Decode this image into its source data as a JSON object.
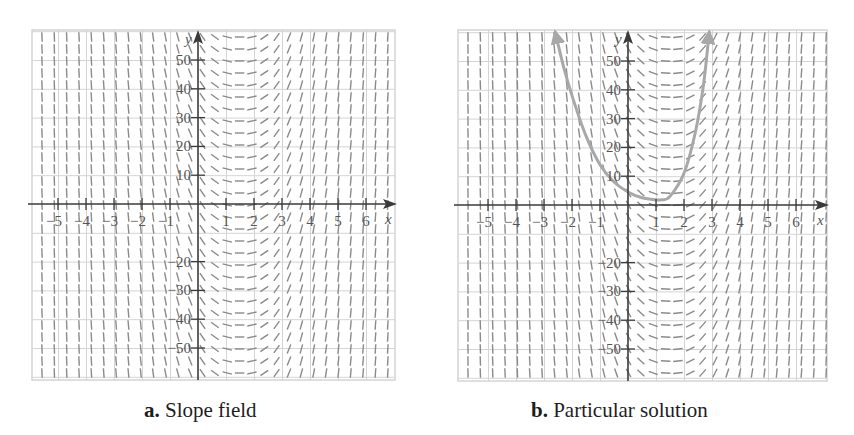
{
  "colors": {
    "grid": "#d4d4d4",
    "axis": "#3a3a3a",
    "slope_segment": "#8a8a8a",
    "curve": "#a8a8a8",
    "text": "#555555"
  },
  "panels": [
    {
      "id": "a",
      "caption_prefix": "a.",
      "caption_text": "Slope field"
    },
    {
      "id": "b",
      "caption_prefix": "b.",
      "caption_text": "Particular solution"
    }
  ],
  "chart_data": [
    {
      "type": "slope_field",
      "title": "a. Slope field",
      "xlabel": "x",
      "ylabel": "y",
      "xlim": [
        -5.9,
        7.0
      ],
      "ylim": [
        -60,
        60
      ],
      "x_ticks": [
        -5,
        -4,
        -3,
        -2,
        -1,
        1,
        2,
        3,
        4,
        5,
        6
      ],
      "y_ticks": [
        10,
        20,
        30,
        40,
        50,
        -20,
        -30,
        -40,
        -50
      ],
      "grid": true,
      "slope_description": "Slopes depend only on x: zero (horizontal) near x = 1.5, negative to the left, positive to the right, becoming nearly vertical far from x = 1.5",
      "zero_slope_x": 1.5
    },
    {
      "type": "slope_field_with_curve",
      "title": "b. Particular solution",
      "xlabel": "x",
      "ylabel": "y",
      "xlim": [
        -5.9,
        7.0
      ],
      "ylim": [
        -60,
        60
      ],
      "x_ticks": [
        -5,
        -4,
        -3,
        -2,
        -1,
        1,
        2,
        3,
        4,
        5,
        6
      ],
      "y_ticks": [
        10,
        20,
        30,
        40,
        50,
        -20,
        -30,
        -40,
        -50
      ],
      "grid": true,
      "zero_slope_x": 1.5,
      "curve": {
        "name": "particular solution",
        "x": [
          -2.6,
          -2.3,
          -2.0,
          -1.5,
          -1.0,
          -0.5,
          0.0,
          0.5,
          1.0,
          1.2,
          1.5,
          2.0,
          2.4,
          2.7,
          2.9
        ],
        "y": [
          60,
          48,
          38,
          24,
          14,
          8,
          4.5,
          2.5,
          1.8,
          1.8,
          3,
          11,
          25,
          42,
          60
        ],
        "arrows_at_ends": true
      }
    }
  ]
}
